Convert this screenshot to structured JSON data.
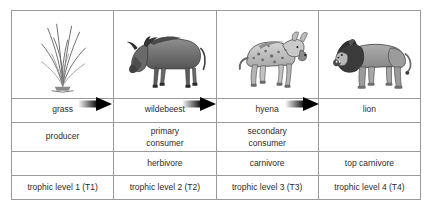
{
  "diagram": {
    "columns": [
      {
        "organism": "grass",
        "art_icon": "grass-illustration",
        "role": "producer",
        "diet": "",
        "level": "trophic level 1 (T1)"
      },
      {
        "organism": "wildebeest",
        "art_icon": "wildebeest-illustration",
        "role": "primary\nconsumer",
        "role_line1": "primary",
        "role_line2": "consumer",
        "diet": "herbivore",
        "level": "trophic level 2 (T2)"
      },
      {
        "organism": "hyena",
        "art_icon": "hyena-illustration",
        "role": "secondary\nconsumer",
        "role_line1": "secondary",
        "role_line2": "consumer",
        "diet": "carnivore",
        "level": "trophic level 3 (T3)"
      },
      {
        "organism": "lion",
        "art_icon": "lion-illustration",
        "role": "",
        "diet": "top carnivore",
        "level": "trophic level 4 (T4)"
      }
    ],
    "arrows": [
      {
        "icon": "energy-flow-arrow-1",
        "from": "grass",
        "to": "wildebeest"
      },
      {
        "icon": "energy-flow-arrow-2",
        "from": "wildebeest",
        "to": "hyena"
      },
      {
        "icon": "energy-flow-arrow-3",
        "from": "hyena",
        "to": "lion"
      }
    ],
    "colors": {
      "border": "#9a9a9a",
      "text": "#2b2b2b",
      "arrow": "#000000",
      "background": "#ffffff"
    }
  }
}
